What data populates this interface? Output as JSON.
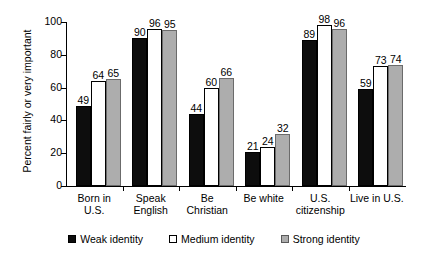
{
  "chart_data": {
    "type": "bar",
    "title": "",
    "xlabel": "",
    "ylabel": "Percent fairly or very important",
    "ylim": [
      0,
      100
    ],
    "yticks": [
      0,
      20,
      40,
      60,
      80,
      100
    ],
    "grid": false,
    "legend_position": "bottom",
    "categories": [
      "Born in U.S.",
      "Speak English",
      "Be Christian",
      "Be white",
      "U.S. citizenship",
      "Live in U.S."
    ],
    "category_lines": [
      [
        "Born in U.S."
      ],
      [
        "Speak",
        "English"
      ],
      [
        "Be Christian"
      ],
      [
        "Be white"
      ],
      [
        "U.S.",
        "citizenship"
      ],
      [
        "Live in U.S."
      ]
    ],
    "series": [
      {
        "name": "Weak identity",
        "color": "#0d0d0d",
        "values": [
          49,
          90,
          44,
          21,
          89,
          59
        ]
      },
      {
        "name": "Medium identity",
        "color": "#ffffff",
        "values": [
          64,
          96,
          60,
          24,
          98,
          73
        ]
      },
      {
        "name": "Strong identity",
        "color": "#adadad",
        "values": [
          65,
          95,
          66,
          32,
          96,
          74
        ]
      }
    ]
  }
}
